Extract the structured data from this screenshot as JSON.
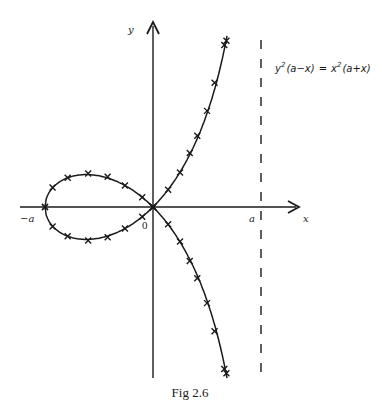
{
  "figure": {
    "caption": "Fig 2.6",
    "equation": {
      "lhs_base": "y",
      "lhs_exp": "2",
      "lhs_factor": "(a−x)",
      "equals": "=",
      "rhs_base": "x",
      "rhs_exp": "2",
      "rhs_factor": "(a+x)"
    },
    "labels": {
      "x_axis": "x",
      "y_axis": "y",
      "origin": "0",
      "neg_a": "−a",
      "pos_a": "a"
    },
    "colors": {
      "ink": "#1a1a1a",
      "background": "#ffffff"
    }
  },
  "chart_data": {
    "type": "line",
    "title": "Fig 2.6",
    "equation": "y^2(a-x) = x^2(a+x)",
    "curve_name": "strophoid",
    "xlabel": "x",
    "ylabel": "y",
    "params": {
      "a": 1
    },
    "asymptote": {
      "x": 1,
      "style": "dashed",
      "label": "a"
    },
    "tick_labels_x": [
      "-a",
      "0",
      "a"
    ],
    "xlim": [
      -1.2,
      1.35
    ],
    "ylim": [
      -1.6,
      1.7
    ],
    "grid": false,
    "marker": "x",
    "branches": [
      {
        "name": "loop-upper",
        "x": [
          -1.0,
          -0.93,
          -0.79,
          -0.6,
          -0.42,
          -0.26,
          -0.1,
          0.0
        ],
        "y": [
          0.0,
          0.18,
          0.27,
          0.31,
          0.28,
          0.2,
          0.09,
          0.0
        ]
      },
      {
        "name": "loop-lower",
        "x": [
          -1.0,
          -0.93,
          -0.79,
          -0.6,
          -0.42,
          -0.26,
          -0.1,
          0.0
        ],
        "y": [
          0.0,
          -0.18,
          -0.27,
          -0.31,
          -0.28,
          -0.2,
          -0.09,
          0.0
        ]
      },
      {
        "name": "upper-right",
        "x": [
          0.0,
          0.14,
          0.25,
          0.34,
          0.41,
          0.5,
          0.57,
          0.66,
          0.68
        ],
        "y": [
          0.0,
          0.16,
          0.32,
          0.5,
          0.66,
          0.89,
          1.15,
          1.5,
          1.54
        ]
      },
      {
        "name": "lower-right",
        "x": [
          0.0,
          0.14,
          0.25,
          0.34,
          0.41,
          0.5,
          0.57,
          0.66,
          0.68
        ],
        "y": [
          0.0,
          -0.16,
          -0.32,
          -0.5,
          -0.66,
          -0.89,
          -1.15,
          -1.5,
          -1.54
        ]
      }
    ]
  }
}
